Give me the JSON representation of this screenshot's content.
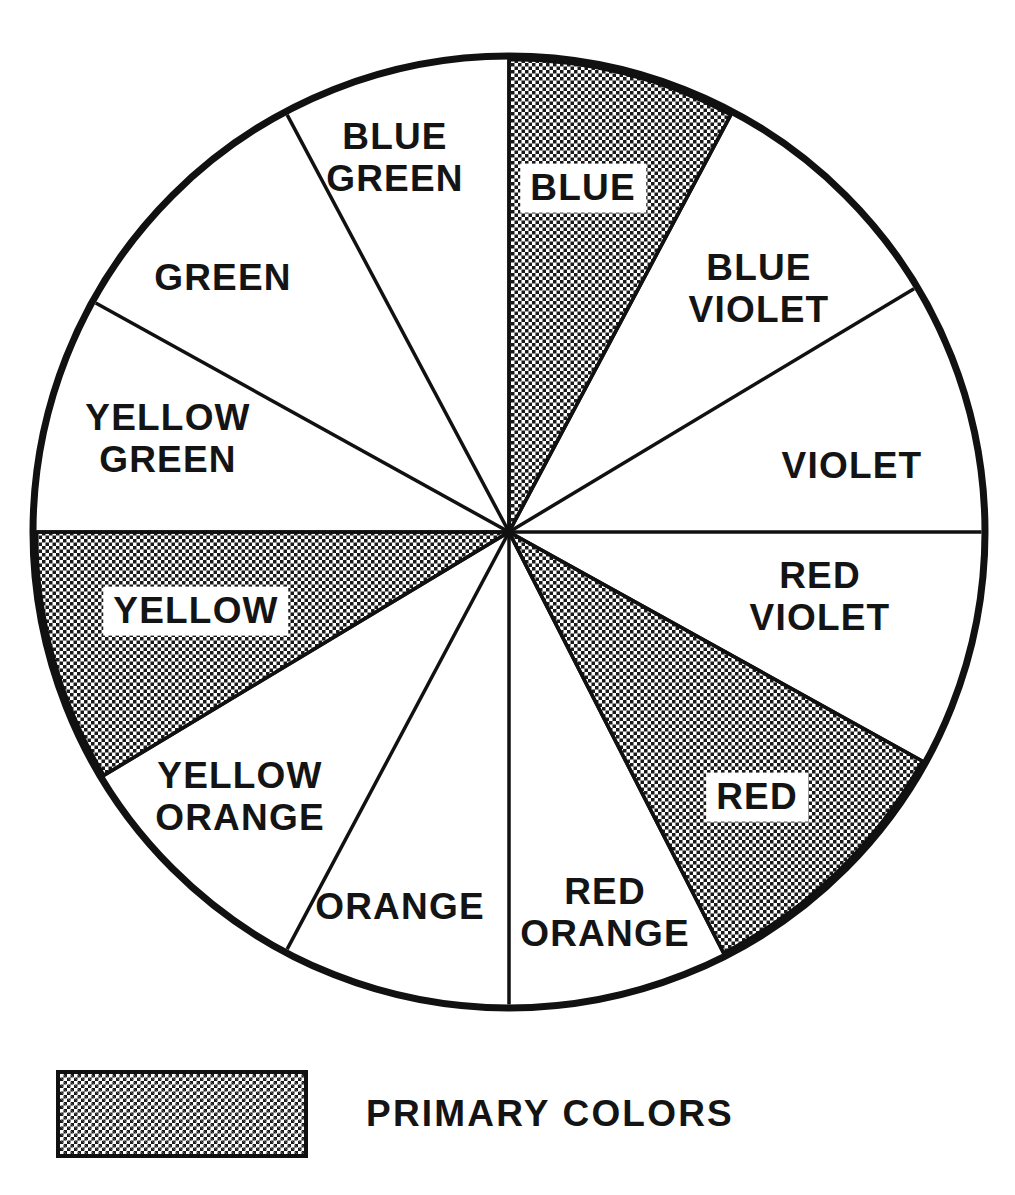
{
  "diagram": {
    "kind": "color-wheel",
    "geometry": {
      "center_x": 509,
      "center_y": 532,
      "radius": 476,
      "rim_stroke_width": 7,
      "spoke_stroke_width": 3.5
    },
    "hatch_color": "#1a1a1a",
    "line_color": "#111111",
    "background_color": "#ffffff"
  },
  "sectors": [
    {
      "id": "blue",
      "label": "BLUE",
      "is_primary": true,
      "boxed_label": true,
      "start_angle": -90,
      "end_angle": -62,
      "label_radius": 0.73,
      "label_x": 583,
      "label_y": 188
    },
    {
      "id": "blue-violet",
      "label": "BLUE\nVIOLET",
      "is_primary": false,
      "boxed_label": false,
      "start_angle": -62,
      "end_angle": -31,
      "label_radius": 0.66,
      "label_x": 759,
      "label_y": 289
    },
    {
      "id": "violet",
      "label": "VIOLET",
      "is_primary": false,
      "boxed_label": false,
      "start_angle": -31,
      "end_angle": 0,
      "label_radius": 0.72,
      "label_x": 852,
      "label_y": 466
    },
    {
      "id": "red-violet",
      "label": "RED\nVIOLET",
      "is_primary": false,
      "boxed_label": false,
      "start_angle": 0,
      "end_angle": 29,
      "label_radius": 0.66,
      "label_x": 820,
      "label_y": 597
    },
    {
      "id": "red",
      "label": "RED",
      "is_primary": true,
      "boxed_label": true,
      "start_angle": 29,
      "end_angle": 63,
      "label_radius": 0.71,
      "label_x": 757,
      "label_y": 797
    },
    {
      "id": "red-orange",
      "label": "RED\nORANGE",
      "is_primary": false,
      "boxed_label": false,
      "start_angle": 63,
      "end_angle": 90,
      "label_radius": 0.72,
      "label_x": 605,
      "label_y": 913
    },
    {
      "id": "orange",
      "label": "ORANGE",
      "is_primary": false,
      "boxed_label": false,
      "start_angle": 90,
      "end_angle": 118,
      "label_radius": 0.76,
      "label_x": 400,
      "label_y": 907
    },
    {
      "id": "yellow-orange",
      "label": "YELLOW\nORANGE",
      "is_primary": false,
      "boxed_label": false,
      "start_angle": 118,
      "end_angle": 149,
      "label_radius": 0.65,
      "label_x": 240,
      "label_y": 797
    },
    {
      "id": "yellow",
      "label": "YELLOW",
      "is_primary": true,
      "boxed_label": true,
      "start_angle": 149,
      "end_angle": 180,
      "label_radius": 0.69,
      "label_x": 196,
      "label_y": 611
    },
    {
      "id": "yellow-green",
      "label": "YELLOW\nGREEN",
      "is_primary": false,
      "boxed_label": false,
      "start_angle": 180,
      "end_angle": 209,
      "label_radius": 0.66,
      "label_x": 168,
      "label_y": 439
    },
    {
      "id": "green",
      "label": "GREEN",
      "is_primary": false,
      "boxed_label": false,
      "start_angle": 209,
      "end_angle": 242,
      "label_radius": 0.69,
      "label_x": 223,
      "label_y": 278
    },
    {
      "id": "blue-green",
      "label": "BLUE\nGREEN",
      "is_primary": false,
      "boxed_label": false,
      "start_angle": 242,
      "end_angle": 270,
      "label_radius": 0.69,
      "label_x": 395,
      "label_y": 158
    }
  ],
  "legend": {
    "swatch_name": "halftone-hatch-swatch",
    "label": "PRIMARY  COLORS"
  }
}
